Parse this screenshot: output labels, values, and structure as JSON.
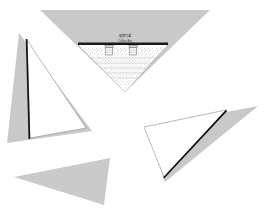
{
  "canvas": {
    "width": 270,
    "height": 223,
    "background": "#ffffff",
    "description": "Shattered UI screenshot broken into triangular shards"
  },
  "palette": {
    "shard_gray": "#c9c9c9",
    "shard_edge_black": "#121212",
    "shard_outline_gray": "#8c8c8c",
    "toolbar_black": "#151515",
    "page_white": "#ffffff",
    "stipple_gray": "#d6d6d6"
  },
  "fragments": [
    {
      "id": "top-shard",
      "name": "top-inverted-triangle-shard",
      "shape": "inverted-triangle",
      "points": "40,10 210,10 125,92",
      "fill": "#c9c9c9",
      "has_content": true
    },
    {
      "id": "left-shard",
      "name": "left-triangle-shard",
      "shape": "triangle",
      "points": "19,33 7,143 92,131",
      "fill": "#c9c9c9",
      "has_content": false
    },
    {
      "id": "left-outline-shard",
      "name": "left-outlined-triangle-shard",
      "shape": "triangle-outline",
      "points": "27,40 86,128 30,138",
      "fill": "#ffffff",
      "has_content": false
    },
    {
      "id": "right-shard",
      "name": "right-triangle-shard",
      "shape": "triangle",
      "points": "258,106 165,180 147,127",
      "fill": "#c9c9c9",
      "has_content": false
    },
    {
      "id": "right-outline-shard",
      "name": "right-outlined-triangle-shard",
      "shape": "triangle-outline",
      "points": "144,127 226,110 164,176",
      "fill": "#ffffff",
      "has_content": false
    },
    {
      "id": "bottom-shard",
      "name": "bottom-left-triangle-shard",
      "shape": "triangle",
      "points": "110,158 14,177 104,205",
      "fill": "#c9c9c9",
      "has_content": false
    }
  ],
  "toolbar": {
    "name": "dark-toolbar-bar",
    "x": 78,
    "y": 43,
    "width": 90,
    "height": 2.6,
    "color": "#151515"
  },
  "labels": {
    "title": "搜索引擎",
    "subtitle": "Collins Bar"
  },
  "widgets": [
    {
      "name": "left-input-box",
      "x": 105,
      "y": 46,
      "width": 8,
      "height": 8,
      "type": "input"
    },
    {
      "name": "right-input-box",
      "x": 129,
      "y": 46,
      "width": 8,
      "height": 8,
      "type": "input"
    }
  ],
  "content_area": {
    "name": "stippled-content-area",
    "description": "light dotted texture representing page body",
    "pattern": "stipple"
  }
}
